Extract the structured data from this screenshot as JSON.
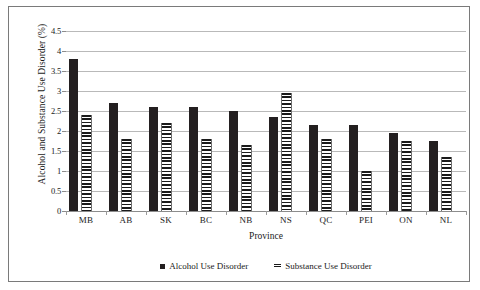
{
  "figure": {
    "frame_color": "#7a7a7a",
    "background": "#ffffff"
  },
  "chart_data": {
    "type": "bar",
    "title": "",
    "xlabel": "Province",
    "ylabel": "Alcohol and Substance Use Disorder (%)",
    "categories": [
      "MB",
      "AB",
      "SK",
      "BC",
      "NB",
      "NS",
      "QC",
      "PEI",
      "ON",
      "NL"
    ],
    "series": [
      {
        "name": "Alcohol Use Disorder",
        "color": "#231f20",
        "pattern": "solid",
        "values": [
          3.8,
          2.7,
          2.6,
          2.6,
          2.5,
          2.35,
          2.15,
          2.15,
          1.95,
          1.75
        ]
      },
      {
        "name": "Substance Use Disorder",
        "color": "#1a1a1a",
        "pattern": "horizontal-stripes",
        "values": [
          2.4,
          1.8,
          2.2,
          1.8,
          1.65,
          2.95,
          1.8,
          1.0,
          1.75,
          1.35
        ]
      }
    ],
    "ylim": [
      0,
      4.5
    ],
    "yticks": [
      0,
      0.5,
      1,
      1.5,
      2,
      2.5,
      3,
      3.5,
      4,
      4.5
    ],
    "ytick_labels": [
      "0",
      "0.5",
      "1",
      "1.5",
      "2",
      "2.5",
      "3",
      "3.5",
      "4",
      "4.5"
    ],
    "grid": true,
    "grid_axis": "y",
    "legend_position": "bottom",
    "legend": [
      "Alcohol Use Disorder",
      "Substance Use Disorder"
    ]
  }
}
